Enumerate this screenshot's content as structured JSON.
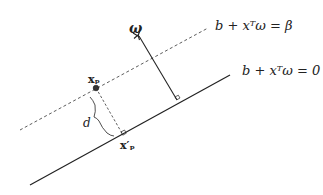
{
  "diagram": {
    "title": "",
    "labels": {
      "dashed_plane_eq": "b + xᵀω = β",
      "solid_plane_eq": "b + xᵀω = 0",
      "normal_vector": "ω",
      "point": "xₚ",
      "projection": "x′ₚ",
      "distance": "d"
    },
    "elements": [
      {
        "type": "line",
        "style": "solid",
        "name": "hyperplane-zero",
        "from": [
          30,
          185
        ],
        "to": [
          230,
          75
        ]
      },
      {
        "type": "line",
        "style": "dashed",
        "name": "hyperplane-beta",
        "from": [
          20,
          130
        ],
        "to": [
          208,
          28
        ]
      },
      {
        "type": "arrow",
        "name": "normal-vector-omega",
        "from": [
          177,
          100
        ],
        "to": [
          138,
          35
        ]
      },
      {
        "type": "point",
        "name": "point-xp",
        "at": [
          96,
          88
        ]
      },
      {
        "type": "line",
        "style": "dashed",
        "name": "perpendicular-xp",
        "from": [
          96,
          88
        ],
        "to": [
          123,
          136
        ]
      },
      {
        "type": "brace",
        "name": "distance-brace",
        "label": "d"
      }
    ],
    "colors": {
      "stroke": "#222222",
      "point_fill": "#333333",
      "background": "#ffffff"
    }
  }
}
